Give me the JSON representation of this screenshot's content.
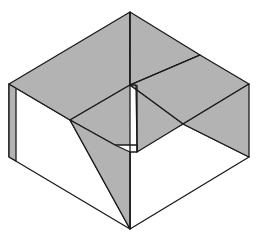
{
  "diagram": {
    "type": "isometric folded paper box (origami)",
    "colors": {
      "shaded": "#b3b3b3",
      "unshaded": "#ffffff",
      "stroke": "#1a1a1a"
    },
    "points": {
      "top": [
        130,
        12
      ],
      "left_top": [
        9,
        84
      ],
      "left_bottom": [
        9,
        157
      ],
      "right_top": [
        249,
        84
      ],
      "right_bottom": [
        249,
        157
      ],
      "bottom": [
        130,
        229
      ],
      "center": [
        130,
        85
      ],
      "inner_left": [
        70,
        120
      ],
      "upper_right_mid": [
        200,
        55
      ],
      "inner_right": [
        183,
        124
      ],
      "inner_bottom": [
        130,
        145
      ]
    }
  }
}
